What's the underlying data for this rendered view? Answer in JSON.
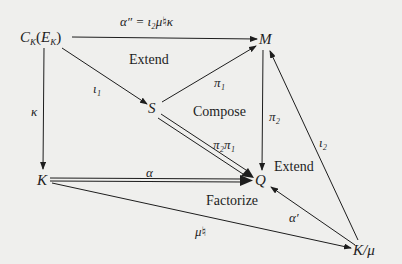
{
  "nodes": {
    "ck": {
      "main": "C",
      "sub": "K",
      "paren_open": "(",
      "inner": "E",
      "inner_sub": "K",
      "paren_close": ")"
    },
    "m": "M",
    "s": "S",
    "k": "K",
    "q": "Q",
    "kmu": "K/μ"
  },
  "arrows": {
    "alpha_dd": {
      "label": "α″ = ι₂μ♮κ",
      "from": "ck",
      "to": "m",
      "style": "single"
    },
    "iota1": {
      "label": "ι₁",
      "from": "ck",
      "to": "s",
      "style": "single"
    },
    "kappa": {
      "label": "κ",
      "from": "ck",
      "to": "k",
      "style": "single"
    },
    "pi1": {
      "label": "π₁",
      "from": "s",
      "to": "m",
      "style": "single"
    },
    "pi2": {
      "label": "π₂",
      "from": "m",
      "to": "q",
      "style": "single"
    },
    "pi2pi1": {
      "label": "π₂π₁",
      "from": "s",
      "to": "q",
      "style": "double"
    },
    "alpha": {
      "label": "α",
      "from": "k",
      "to": "q",
      "style": "double"
    },
    "iota2": {
      "label": "ι₂",
      "from": "kmu",
      "to": "m",
      "style": "single"
    },
    "alpha_prime": {
      "label": "α′",
      "from": "kmu",
      "to": "q",
      "style": "single"
    },
    "mu_natural": {
      "label": "μ♮",
      "from": "k",
      "to": "kmu",
      "style": "single"
    }
  },
  "regions": {
    "extend_top": "Extend",
    "compose": "Compose",
    "extend_right": "Extend",
    "factorize": "Factorize"
  },
  "colors": {
    "background": "#efefed",
    "ink": "#1d1d1d"
  }
}
